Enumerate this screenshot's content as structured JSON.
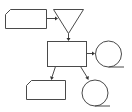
{
  "diagram": {
    "type": "flowchart",
    "background": "#ffffff",
    "stroke_color": "#4a4a4a",
    "nodes": [
      {
        "id": "input-top",
        "shape": "card",
        "label": ""
      },
      {
        "id": "merge",
        "shape": "inverted-triangle",
        "label": ""
      },
      {
        "id": "process",
        "shape": "rectangle",
        "label": ""
      },
      {
        "id": "storage-right",
        "shape": "sequential-storage-circle",
        "label": ""
      },
      {
        "id": "output-bottom",
        "shape": "card",
        "label": ""
      },
      {
        "id": "storage-bottom",
        "shape": "sequential-storage-circle",
        "label": ""
      }
    ],
    "edges": [
      {
        "from": "input-top",
        "to": "merge"
      },
      {
        "from": "merge",
        "to": "process"
      },
      {
        "from": "process",
        "to": "storage-right"
      },
      {
        "from": "process",
        "to": "output-bottom"
      },
      {
        "from": "process",
        "to": "storage-bottom"
      }
    ]
  }
}
